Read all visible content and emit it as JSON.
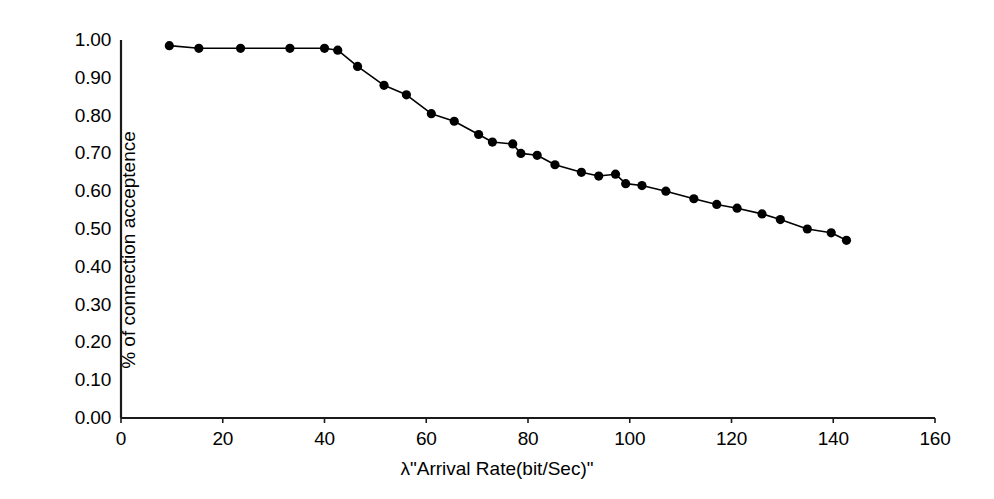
{
  "chart_data": {
    "type": "line",
    "title": "",
    "subtitle": "",
    "xlabel": "λ\"Arrival Rate(bit/Sec)\"",
    "ylabel": "% of connection acceptence",
    "xlim": [
      0,
      160
    ],
    "ylim": [
      0.0,
      1.0
    ],
    "xticks": [
      0,
      20,
      40,
      60,
      80,
      100,
      120,
      140,
      160
    ],
    "xtick_labels": [
      "0",
      "20",
      "40",
      "60",
      "80",
      "100",
      "120",
      "140",
      "160"
    ],
    "yticks": [
      0.0,
      0.1,
      0.2,
      0.3,
      0.4,
      0.5,
      0.6,
      0.7,
      0.8,
      0.9,
      1.0
    ],
    "ytick_labels": [
      "0.00",
      "0.10",
      "0.20",
      "0.30",
      "0.40",
      "0.50",
      "0.60",
      "0.70",
      "0.80",
      "0.90",
      "1.00"
    ],
    "grid": false,
    "legend": false,
    "legend_position": "none",
    "marker": "filled-circle",
    "marker_color": "#000000",
    "line_color": "#000000",
    "line_width": 1.6,
    "marker_size": 6,
    "series": [
      {
        "name": "% of connection acceptence",
        "x": [
          9.5,
          15.3,
          23.5,
          33.2,
          40.0,
          42.6,
          46.5,
          51.7,
          56.1,
          61.0,
          65.5,
          70.3,
          73.0,
          77.0,
          78.6,
          81.8,
          85.3,
          90.5,
          93.9,
          97.2,
          99.2,
          102.4,
          107.1,
          112.6,
          117.1,
          121.1,
          126.0,
          129.6,
          134.9,
          139.6,
          142.6
        ],
        "y": [
          0.985,
          0.978,
          0.978,
          0.978,
          0.978,
          0.973,
          0.93,
          0.88,
          0.855,
          0.805,
          0.785,
          0.75,
          0.73,
          0.725,
          0.7,
          0.695,
          0.67,
          0.65,
          0.64,
          0.645,
          0.62,
          0.615,
          0.6,
          0.58,
          0.565,
          0.555,
          0.54,
          0.525,
          0.5,
          0.49,
          0.47
        ]
      }
    ]
  },
  "axes": {
    "plot_left_px": 121,
    "plot_right_px": 935,
    "plot_top_px": 40,
    "plot_bottom_px": 418
  }
}
